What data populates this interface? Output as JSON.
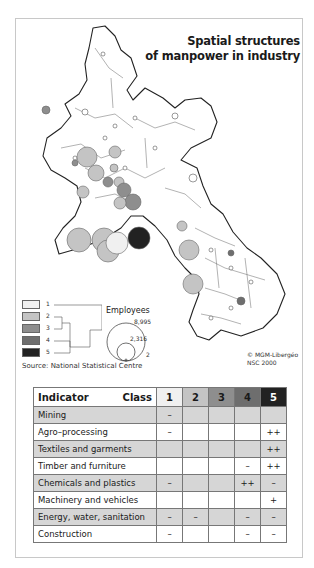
{
  "title": {
    "line1": "Spatial structures",
    "line2": "of manpower in industry"
  },
  "legend": {
    "classes": [
      {
        "label": "1",
        "color": "#f0f0f0"
      },
      {
        "label": "2",
        "color": "#c4c4c4"
      },
      {
        "label": "3",
        "color": "#8e8e8e"
      },
      {
        "label": "4",
        "color": "#6e6e6e"
      },
      {
        "label": "5",
        "color": "#222222"
      }
    ],
    "employees_title": "Employees",
    "employees_values": [
      "8,995",
      "2,316",
      "2"
    ]
  },
  "source": "Source: National Statistical Centre",
  "credit": {
    "line1": "© MGM-Libergéo",
    "line2": "NSC 2000"
  },
  "table": {
    "header_indicator": "Indicator",
    "header_class": "Class",
    "class_columns": [
      "1",
      "2",
      "3",
      "4",
      "5"
    ],
    "rows": [
      {
        "indicator": "Mining",
        "values": [
          "–",
          "",
          "",
          "",
          ""
        ]
      },
      {
        "indicator": "Agro–processing",
        "values": [
          "–",
          "",
          "",
          "",
          "++"
        ]
      },
      {
        "indicator": "Textiles and garments",
        "values": [
          "",
          "",
          "",
          "",
          "++"
        ]
      },
      {
        "indicator": "Timber and furniture",
        "values": [
          "",
          "",
          "",
          "–",
          "++"
        ]
      },
      {
        "indicator": "Chemicals and plastics",
        "values": [
          "–",
          "",
          "",
          "++",
          "–"
        ]
      },
      {
        "indicator": "Machinery and vehicles",
        "values": [
          "",
          "",
          "",
          "",
          "+"
        ]
      },
      {
        "indicator": "Energy, water, sanitation",
        "values": [
          "–",
          "–",
          "",
          "–",
          "–"
        ]
      },
      {
        "indicator": "Construction",
        "values": [
          "–",
          "",
          "",
          "–",
          "–"
        ]
      }
    ]
  }
}
